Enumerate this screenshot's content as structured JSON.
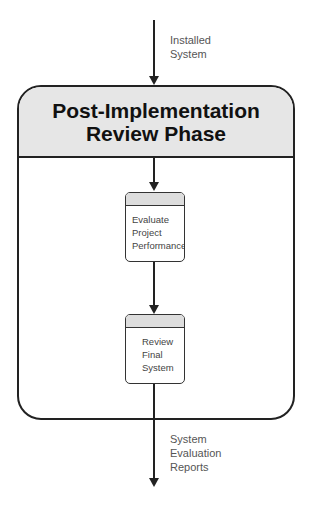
{
  "input_flow": {
    "label_lines": [
      "Installed",
      "System"
    ]
  },
  "phase": {
    "title_lines": [
      "Post-Implementation",
      "Review Phase"
    ]
  },
  "processes": [
    {
      "label_lines": [
        "Evaluate",
        "Project",
        "Performance"
      ]
    },
    {
      "label_lines": [
        "Review",
        "Final",
        "System"
      ]
    }
  ],
  "output_flow": {
    "label_lines": [
      "System",
      "Evaluation",
      "Reports"
    ]
  },
  "colors": {
    "header_fill": "#e6e6e6",
    "process_tab_fill": "#dddddd",
    "stroke": "#222222"
  }
}
